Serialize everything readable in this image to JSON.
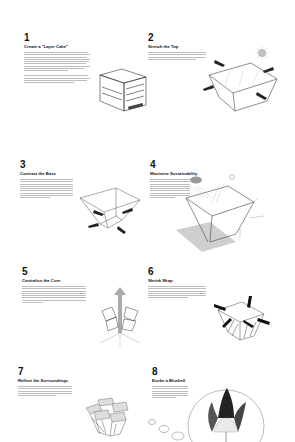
{
  "steps": [
    {
      "number": "1",
      "title": "Create a \"Layer Cake\"",
      "box_labels": [
        "",
        "CREATIVE",
        "CIVIC",
        ""
      ]
    },
    {
      "number": "2",
      "title": "Stretch the Top"
    },
    {
      "number": "3",
      "title": "Contract the Base"
    },
    {
      "number": "4",
      "title": "Maximise Sustainability"
    },
    {
      "number": "5",
      "title": "Centralise the Core"
    },
    {
      "number": "6",
      "title": "Shrink Wrap"
    },
    {
      "number": "7",
      "title": "Reflect the Surroundings"
    },
    {
      "number": "8",
      "title": "Evoke a Bluebell"
    }
  ],
  "colors": {
    "background": "#ffffff",
    "text": "#111111",
    "body_text": "#bdbdbd",
    "line_art": "#333333"
  }
}
